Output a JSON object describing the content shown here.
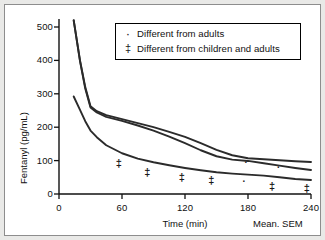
{
  "figure": {
    "background": "#e9e9e7",
    "plot_background": "#ffffff",
    "border_color": "#8d8d8d",
    "mean_sem_note": "Mean. SEM"
  },
  "legend": {
    "position": "top-center",
    "entries": [
      {
        "symbol": "·",
        "symbol_name": "dot-marker",
        "label": "Different from adults"
      },
      {
        "symbol": "‡",
        "symbol_name": "double-dagger-marker",
        "label": "Different from children and adults"
      }
    ]
  },
  "chart_data": {
    "type": "line",
    "title": "",
    "subtitle": "",
    "xlabel": "Time (min)",
    "ylabel": "Fentanyl (pg/mL)",
    "xlim": [
      0,
      240
    ],
    "ylim": [
      0,
      500
    ],
    "xticks": [
      0,
      60,
      120,
      180,
      240
    ],
    "yticks": [
      0,
      100,
      200,
      300,
      400,
      500
    ],
    "xtick_labels": [
      "0",
      "60",
      "120",
      "180",
      "240"
    ],
    "ytick_labels": [
      "0",
      "100",
      "200",
      "300",
      "400",
      "500"
    ],
    "grid": false,
    "legend_position": "top-center",
    "line_color": "#2b2b2b",
    "series": [
      {
        "name": "upper-curve",
        "x": [
          14,
          20,
          25,
          30,
          36,
          45,
          60,
          75,
          90,
          105,
          120,
          135,
          150,
          165,
          180,
          195,
          210,
          225,
          240
        ],
        "values": [
          520,
          400,
          320,
          263,
          248,
          236,
          224,
          212,
          200,
          186,
          171,
          152,
          132,
          116,
          107,
          104,
          101,
          98,
          96
        ]
      },
      {
        "name": "middle-curve",
        "x": [
          14,
          20,
          25,
          30,
          36,
          45,
          60,
          75,
          90,
          105,
          120,
          135,
          150,
          165,
          180,
          195,
          210,
          225,
          240
        ],
        "values": [
          520,
          398,
          316,
          259,
          244,
          231,
          219,
          205,
          190,
          172,
          152,
          131,
          113,
          103,
          99,
          92,
          85,
          78,
          72
        ]
      },
      {
        "name": "lower-curve",
        "x": [
          14,
          20,
          25,
          30,
          36,
          45,
          60,
          75,
          90,
          105,
          120,
          135,
          150,
          165,
          180,
          195,
          210,
          225,
          240
        ],
        "values": [
          292,
          252,
          218,
          190,
          170,
          146,
          122,
          106,
          95,
          86,
          78,
          71,
          65,
          61,
          58,
          55,
          50,
          45,
          42
        ]
      }
    ],
    "annotations": [
      {
        "symbol": "‡",
        "name": "double-dagger-marker",
        "x": 57,
        "y": 90
      },
      {
        "symbol": "‡",
        "name": "double-dagger-marker",
        "x": 84,
        "y": 63
      },
      {
        "symbol": "‡",
        "name": "double-dagger-marker",
        "x": 117,
        "y": 48
      },
      {
        "symbol": "‡",
        "name": "double-dagger-marker",
        "x": 145,
        "y": 38
      },
      {
        "symbol": "·",
        "name": "dot-marker",
        "x": 176,
        "y": 35
      },
      {
        "symbol": "·",
        "name": "dot-marker",
        "x": 178,
        "y": 93
      },
      {
        "symbol": "‡",
        "name": "double-dagger-marker",
        "x": 203,
        "y": 20
      },
      {
        "symbol": "·",
        "name": "dot-marker",
        "x": 209,
        "y": 78
      },
      {
        "symbol": "‡",
        "name": "double-dagger-marker",
        "x": 236,
        "y": 16
      }
    ]
  }
}
